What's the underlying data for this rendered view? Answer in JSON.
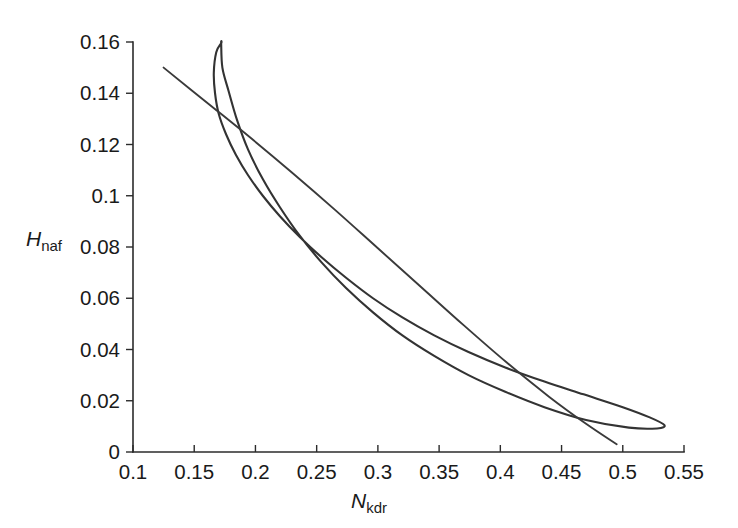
{
  "figure": {
    "background_color": "#ffffff",
    "curve_color": "#333333",
    "axis_color": "#2b2b2b"
  },
  "axes": {
    "x": {
      "symbol": "N",
      "subscript": "kdr",
      "label": "N_kdr",
      "min": 0.1,
      "max": 0.55,
      "tick_step": 0.05,
      "tick_labels": [
        "0.1",
        "0.15",
        "0.2",
        "0.25",
        "0.3",
        "0.35",
        "0.4",
        "0.45",
        "0.5",
        "0.55"
      ],
      "tick_values": [
        0.1,
        0.15,
        0.2,
        0.25,
        0.3,
        0.35,
        0.4,
        0.45,
        0.5,
        0.55
      ]
    },
    "y": {
      "symbol": "H",
      "subscript": "naf",
      "label": "H_naf",
      "min": 0,
      "max": 0.16,
      "tick_step": 0.02,
      "tick_labels": [
        "0",
        "0.02",
        "0.04",
        "0.06",
        "0.08",
        "0.1",
        "0.12",
        "0.14",
        "0.16"
      ],
      "tick_values": [
        0,
        0.02,
        0.04,
        0.06,
        0.08,
        0.1,
        0.12,
        0.14,
        0.16
      ]
    }
  },
  "chart_data": {
    "type": "line",
    "title": "",
    "subtitle": "",
    "xlabel": "N_kdr",
    "ylabel": "H_naf",
    "xlim": [
      0.1,
      0.55
    ],
    "ylim": [
      0,
      0.16
    ],
    "grid": false,
    "legend": "none",
    "annotations": [],
    "series": [
      {
        "name": "closed-loop-nullcline",
        "style": "solid",
        "color": "#333333",
        "closed": true,
        "description": "Narrow closed loop: rises steeply to an apex near (0.172, 0.1595), then both branches sweep down to the right and converge at a sharp tip near (0.534, 0.0105).",
        "points": [
          [
            0.172,
            0.1595
          ],
          [
            0.168,
            0.156
          ],
          [
            0.166,
            0.148
          ],
          [
            0.167,
            0.14
          ],
          [
            0.17,
            0.132
          ],
          [
            0.176,
            0.124
          ],
          [
            0.184,
            0.116
          ],
          [
            0.194,
            0.108
          ],
          [
            0.206,
            0.1
          ],
          [
            0.22,
            0.092
          ],
          [
            0.236,
            0.084
          ],
          [
            0.254,
            0.076
          ],
          [
            0.274,
            0.068
          ],
          [
            0.296,
            0.06
          ],
          [
            0.32,
            0.0525
          ],
          [
            0.346,
            0.0455
          ],
          [
            0.374,
            0.039
          ],
          [
            0.404,
            0.033
          ],
          [
            0.436,
            0.0275
          ],
          [
            0.468,
            0.0225
          ],
          [
            0.5,
            0.0175
          ],
          [
            0.522,
            0.0135
          ],
          [
            0.534,
            0.0105
          ],
          [
            0.528,
            0.0092
          ],
          [
            0.505,
            0.0095
          ],
          [
            0.47,
            0.0125
          ],
          [
            0.436,
            0.0175
          ],
          [
            0.404,
            0.0235
          ],
          [
            0.374,
            0.03
          ],
          [
            0.346,
            0.0375
          ],
          [
            0.32,
            0.0455
          ],
          [
            0.296,
            0.0545
          ],
          [
            0.274,
            0.064
          ],
          [
            0.254,
            0.074
          ],
          [
            0.236,
            0.0845
          ],
          [
            0.22,
            0.0955
          ],
          [
            0.206,
            0.1065
          ],
          [
            0.194,
            0.118
          ],
          [
            0.185,
            0.1295
          ],
          [
            0.178,
            0.141
          ],
          [
            0.173,
            0.15
          ],
          [
            0.172,
            0.1595
          ]
        ]
      },
      {
        "name": "straight-nullcline",
        "style": "solid",
        "color": "#333333",
        "closed": false,
        "description": "Nearly straight, slightly convex line descending from upper-left (0.125, 0.150) to lower-right (0.495, 0.003).",
        "points": [
          [
            0.125,
            0.15
          ],
          [
            0.16,
            0.1365
          ],
          [
            0.195,
            0.123
          ],
          [
            0.23,
            0.109
          ],
          [
            0.265,
            0.0945
          ],
          [
            0.3,
            0.0795
          ],
          [
            0.335,
            0.0645
          ],
          [
            0.37,
            0.0495
          ],
          [
            0.405,
            0.035
          ],
          [
            0.44,
            0.0215
          ],
          [
            0.47,
            0.011
          ],
          [
            0.495,
            0.003
          ]
        ]
      }
    ],
    "intersections": [
      [
        0.195,
        0.126
      ],
      [
        0.25,
        0.1
      ],
      [
        0.318,
        0.06
      ],
      [
        0.4,
        0.041
      ]
    ]
  }
}
